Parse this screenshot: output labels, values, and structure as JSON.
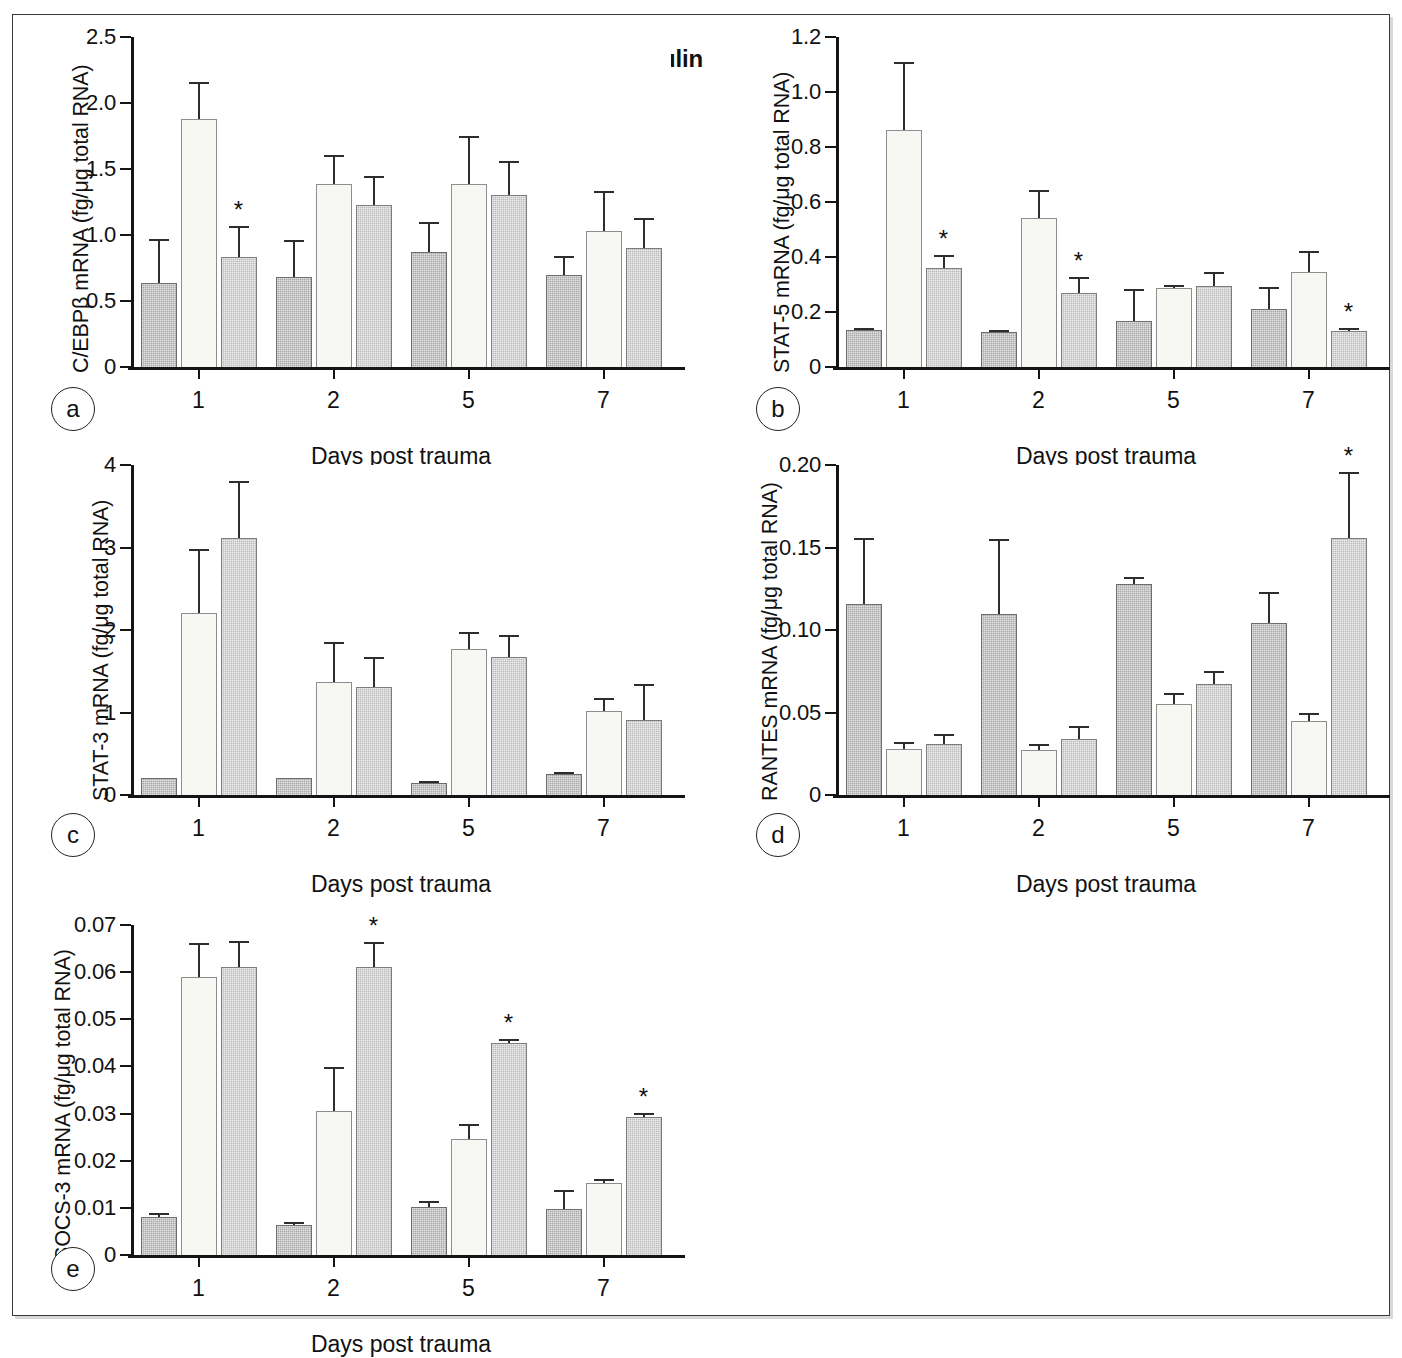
{
  "figure": {
    "legend": {
      "items": [
        {
          "label": "Normal",
          "key": "normal",
          "color": "#a9a9a9"
        },
        {
          "label": "Saline",
          "key": "saline",
          "color": "#f7f7f3"
        },
        {
          "label": "Insulin",
          "key": "insulin",
          "color": "#bcbcbc"
        }
      ]
    },
    "panel_letters": [
      "a",
      "b",
      "c",
      "d",
      "e"
    ],
    "shared_xlabel": "Days post trauma",
    "shared_categories": [
      "1",
      "2",
      "5",
      "7"
    ],
    "significance_marker": "*"
  },
  "chart_data": [
    {
      "panel": "a",
      "type": "bar",
      "title": "",
      "xlabel": "Days post trauma",
      "ylabel": "C/EBPβ mRNA (fg/μg total RNA)",
      "categories": [
        "1",
        "2",
        "5",
        "7"
      ],
      "ylim": [
        0,
        2.5
      ],
      "yticks": [
        0,
        0.5,
        1.0,
        1.5,
        2.0,
        2.5
      ],
      "ytick_labels": [
        "0",
        "0.5",
        "1.0",
        "1.5",
        "2.0",
        "2.5"
      ],
      "grid": false,
      "legend_position": "top-center",
      "series": [
        {
          "name": "Normal",
          "values": [
            0.64,
            0.68,
            0.87,
            0.7
          ],
          "errors": [
            0.33,
            0.28,
            0.23,
            0.14
          ],
          "sig": [
            false,
            false,
            false,
            false
          ]
        },
        {
          "name": "Saline",
          "values": [
            1.88,
            1.39,
            1.39,
            1.03
          ],
          "errors": [
            0.28,
            0.22,
            0.36,
            0.3
          ],
          "sig": [
            false,
            false,
            false,
            false
          ]
        },
        {
          "name": "Insulin",
          "values": [
            0.83,
            1.23,
            1.3,
            0.9
          ],
          "errors": [
            0.24,
            0.22,
            0.26,
            0.23
          ],
          "sig": [
            true,
            false,
            false,
            false
          ]
        }
      ]
    },
    {
      "panel": "b",
      "type": "bar",
      "title": "",
      "xlabel": "Days post trauma",
      "ylabel": "STAT-5 mRNA (fg/μg total RNA)",
      "categories": [
        "1",
        "2",
        "5",
        "7"
      ],
      "ylim": [
        0,
        1.2
      ],
      "yticks": [
        0,
        0.2,
        0.4,
        0.6,
        0.8,
        1.0,
        1.2
      ],
      "ytick_labels": [
        "0",
        "0.2",
        "0.4",
        "0.6",
        "0.8",
        "1.0",
        "1.2"
      ],
      "grid": false,
      "legend_position": "none",
      "series": [
        {
          "name": "Normal",
          "values": [
            0.133,
            0.128,
            0.167,
            0.212
          ],
          "errors": [
            0.006,
            0.004,
            0.117,
            0.078
          ],
          "sig": [
            false,
            false,
            false,
            false
          ]
        },
        {
          "name": "Saline",
          "values": [
            0.863,
            0.543,
            0.287,
            0.346
          ],
          "errors": [
            0.247,
            0.102,
            0.01,
            0.077
          ],
          "sig": [
            false,
            false,
            false,
            false
          ]
        },
        {
          "name": "Insulin",
          "values": [
            0.36,
            0.27,
            0.296,
            0.131
          ],
          "errors": [
            0.047,
            0.057,
            0.049,
            0.01
          ],
          "sig": [
            true,
            true,
            false,
            true
          ]
        }
      ]
    },
    {
      "panel": "c",
      "type": "bar",
      "title": "",
      "xlabel": "Days post trauma",
      "ylabel": "STAT-3 mRNA (fg/μg total RNA)",
      "categories": [
        "1",
        "2",
        "5",
        "7"
      ],
      "ylim": [
        0,
        4
      ],
      "yticks": [
        0,
        1,
        2,
        3,
        4
      ],
      "ytick_labels": [
        "0",
        "1",
        "2",
        "3",
        "4"
      ],
      "grid": false,
      "legend_position": "none",
      "series": [
        {
          "name": "Normal",
          "values": [
            0.21,
            0.21,
            0.14,
            0.26
          ],
          "errors": [
            0.0,
            0.0,
            0.02,
            0.02
          ],
          "sig": [
            false,
            false,
            false,
            false
          ]
        },
        {
          "name": "Saline",
          "values": [
            2.21,
            1.37,
            1.77,
            1.02
          ],
          "errors": [
            0.77,
            0.48,
            0.21,
            0.15
          ],
          "sig": [
            false,
            false,
            false,
            false
          ]
        },
        {
          "name": "Insulin",
          "values": [
            3.12,
            1.31,
            1.67,
            0.91
          ],
          "errors": [
            0.69,
            0.36,
            0.27,
            0.43
          ],
          "sig": [
            false,
            false,
            false,
            false
          ]
        }
      ]
    },
    {
      "panel": "d",
      "type": "bar",
      "title": "",
      "xlabel": "Days post trauma",
      "ylabel": "RANTES mRNA (fg/μg total RNA)",
      "categories": [
        "1",
        "2",
        "5",
        "7"
      ],
      "ylim": [
        0,
        0.2
      ],
      "yticks": [
        0,
        0.05,
        0.1,
        0.15,
        0.2
      ],
      "ytick_labels": [
        "0",
        "0.05",
        "0.10",
        "0.15",
        "0.20"
      ],
      "grid": false,
      "legend_position": "none",
      "series": [
        {
          "name": "Normal",
          "values": [
            0.116,
            0.11,
            0.128,
            0.104
          ],
          "errors": [
            0.04,
            0.045,
            0.004,
            0.019
          ],
          "sig": [
            false,
            false,
            false,
            false
          ]
        },
        {
          "name": "Saline",
          "values": [
            0.028,
            0.027,
            0.055,
            0.045
          ],
          "errors": [
            0.004,
            0.004,
            0.007,
            0.005
          ],
          "sig": [
            false,
            false,
            false,
            false
          ]
        },
        {
          "name": "Insulin",
          "values": [
            0.031,
            0.034,
            0.067,
            0.156
          ],
          "errors": [
            0.006,
            0.008,
            0.008,
            0.04
          ],
          "sig": [
            false,
            false,
            false,
            true
          ]
        }
      ]
    },
    {
      "panel": "e",
      "type": "bar",
      "title": "",
      "xlabel": "Days post trauma",
      "ylabel": "SOCS-3 mRNA (fg/μg total RNA)",
      "categories": [
        "1",
        "2",
        "5",
        "7"
      ],
      "ylim": [
        0,
        0.07
      ],
      "yticks": [
        0,
        0.01,
        0.02,
        0.03,
        0.04,
        0.05,
        0.06,
        0.07
      ],
      "ytick_labels": [
        "0",
        "0.01",
        "0.02",
        "0.03",
        "0.04",
        "0.05",
        "0.06",
        "0.07"
      ],
      "grid": false,
      "legend_position": "none",
      "series": [
        {
          "name": "Normal",
          "values": [
            0.0081,
            0.0064,
            0.0102,
            0.0098
          ],
          "errors": [
            0.0009,
            0.0007,
            0.0012,
            0.004
          ],
          "sig": [
            false,
            false,
            false,
            false
          ]
        },
        {
          "name": "Saline",
          "values": [
            0.0589,
            0.0306,
            0.0247,
            0.0152
          ],
          "errors": [
            0.0072,
            0.0093,
            0.0031,
            0.0009
          ],
          "sig": [
            false,
            false,
            false,
            false
          ]
        },
        {
          "name": "Insulin",
          "values": [
            0.061,
            0.061,
            0.045,
            0.0292
          ],
          "errors": [
            0.0057,
            0.0055,
            0.0009,
            0.0009
          ],
          "sig": [
            false,
            true,
            true,
            true
          ]
        }
      ]
    }
  ]
}
